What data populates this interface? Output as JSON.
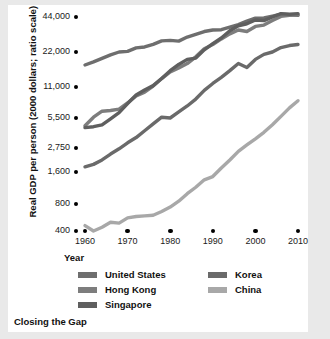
{
  "caption": "Closing the Gap",
  "axis": {
    "y_title": "Real GDP per person (2000 dollars; ratio scale)",
    "x_title": "Year"
  },
  "legend": {
    "left_column": [
      {
        "label": "United States",
        "color": "#6e6e6e"
      },
      {
        "label": "Hong Kong",
        "color": "#7d7d7d"
      },
      {
        "label": "Singapore",
        "color": "#5f5f5f"
      }
    ],
    "right_column": [
      {
        "label": "Korea",
        "color": "#6a6a6a"
      },
      {
        "label": "China",
        "color": "#a8a8a8"
      }
    ]
  },
  "chart_data": {
    "type": "line",
    "title": "Closing the Gap",
    "xlabel": "Year",
    "ylabel": "Real GDP per person (2000 dollars; ratio scale)",
    "scale": "log",
    "grid": false,
    "legend_position": "bottom",
    "xlim": [
      1960,
      2010
    ],
    "ylim": [
      400,
      44000
    ],
    "x_ticks": [
      "1960",
      "1970",
      "1980",
      "1990",
      "2000",
      "2010"
    ],
    "y_ticks": [
      "400",
      "800",
      "1,600",
      "2,750",
      "5,500",
      "11,000",
      "22,000",
      "44,000"
    ],
    "y_tick_values": [
      400,
      800,
      1600,
      2750,
      5500,
      11000,
      22000,
      44000
    ],
    "series": [
      {
        "name": "United States",
        "color": "#6e6e6e",
        "x": [
          1960,
          1962,
          1964,
          1966,
          1968,
          1970,
          1972,
          1974,
          1976,
          1978,
          1980,
          1982,
          1984,
          1986,
          1988,
          1990,
          1992,
          1994,
          1996,
          1998,
          2000,
          2002,
          2004,
          2006,
          2008,
          2010
        ],
        "values": [
          17000,
          18100,
          19400,
          20800,
          22000,
          22300,
          23900,
          24300,
          25600,
          27400,
          27700,
          27300,
          29600,
          31200,
          33000,
          34000,
          34200,
          36000,
          37800,
          40500,
          43000,
          43200,
          44800,
          46500,
          46000,
          45500
        ]
      },
      {
        "name": "Hong Kong",
        "color": "#7d7d7d",
        "x": [
          1960,
          1962,
          1964,
          1966,
          1968,
          1970,
          1972,
          1974,
          1976,
          1978,
          1980,
          1982,
          1984,
          1986,
          1988,
          1990,
          1992,
          1994,
          1996,
          1998,
          2000,
          2002,
          2004,
          2006,
          2008,
          2010
        ],
        "values": [
          4600,
          5600,
          6400,
          6500,
          6700,
          7700,
          9000,
          9800,
          11200,
          13000,
          14800,
          16000,
          17500,
          20000,
          23500,
          25500,
          28500,
          31500,
          34000,
          33000,
          36500,
          37500,
          41000,
          44500,
          45500,
          46000
        ]
      },
      {
        "name": "Singapore",
        "color": "#5f5f5f",
        "x": [
          1960,
          1962,
          1964,
          1966,
          1968,
          1970,
          1972,
          1974,
          1976,
          1978,
          1980,
          1982,
          1984,
          1986,
          1988,
          1990,
          1992,
          1994,
          1996,
          1998,
          2000,
          2002,
          2004,
          2006,
          2008,
          2010
        ],
        "values": [
          4400,
          4500,
          4700,
          5400,
          6200,
          7600,
          9200,
          10300,
          11300,
          13000,
          15200,
          17200,
          19000,
          19500,
          23000,
          26000,
          29000,
          33500,
          37000,
          38500,
          41500,
          41000,
          44000,
          47000,
          46500,
          47000
        ]
      },
      {
        "name": "Korea",
        "color": "#6a6a6a",
        "x": [
          1960,
          1962,
          1964,
          1966,
          1968,
          1970,
          1972,
          1974,
          1976,
          1978,
          1980,
          1982,
          1984,
          1986,
          1988,
          1990,
          1992,
          1994,
          1996,
          1998,
          2000,
          2002,
          2004,
          2006,
          2008,
          2010
        ],
        "values": [
          1800,
          1900,
          2100,
          2400,
          2700,
          3100,
          3500,
          4100,
          4800,
          5600,
          5500,
          6300,
          7200,
          8400,
          10200,
          11800,
          13300,
          15200,
          17500,
          16200,
          19000,
          21000,
          22000,
          24000,
          25000,
          25500
        ]
      },
      {
        "name": "China",
        "color": "#a8a8a8",
        "x": [
          1960,
          1962,
          1964,
          1966,
          1968,
          1970,
          1972,
          1974,
          1976,
          1978,
          1980,
          1982,
          1984,
          1986,
          1988,
          1990,
          1992,
          1994,
          1996,
          1998,
          2000,
          2002,
          2004,
          2006,
          2008,
          2010
        ],
        "values": [
          460,
          400,
          440,
          500,
          490,
          560,
          580,
          590,
          600,
          660,
          740,
          850,
          1000,
          1150,
          1350,
          1450,
          1750,
          2100,
          2550,
          2950,
          3400,
          3950,
          4700,
          5700,
          6900,
          8100
        ]
      }
    ]
  }
}
